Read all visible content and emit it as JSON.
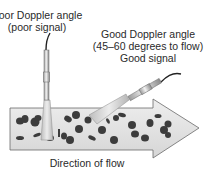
{
  "diagram": {
    "labels": {
      "poor_angle": "Poor Doppler angle",
      "poor_signal": "(poor signal)",
      "good_angle": "Good Doppler angle",
      "good_range": "(45–60 degrees to flow)",
      "good_signal": "Good signal",
      "flow_direction": "Direction of flow"
    },
    "elements": {
      "poor_probe": {
        "orientation": "vertical",
        "angle_to_flow_deg": 90
      },
      "good_probe": {
        "orientation": "angled",
        "angle_to_flow_range": "45–60"
      },
      "flow_arrow": {
        "direction": "right",
        "contains": "blood cells"
      }
    },
    "colors": {
      "arrow_fill": "#e2e2e2",
      "arrow_stroke": "#6a6a6a",
      "cell_fill": "#3c3c3c",
      "probe_fill": "#d4d4d4",
      "beam_fill": "#cfcfcf",
      "text": "#2a2a2a"
    }
  }
}
